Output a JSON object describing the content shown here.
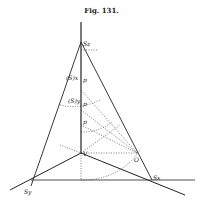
{
  "figure": {
    "title": "Fig. 131."
  },
  "labels": {
    "top": "S_z",
    "left_upper": "(S)_x",
    "left_lower": "(S)_y",
    "mid1": "p_1",
    "mid2": "p_2",
    "mid3": "p_3",
    "center": "V",
    "right_point": "O",
    "bottom_left": "S_y",
    "bottom_right": "S_x"
  },
  "colors": {
    "ink": "#222222",
    "paper": "#ffffff"
  }
}
